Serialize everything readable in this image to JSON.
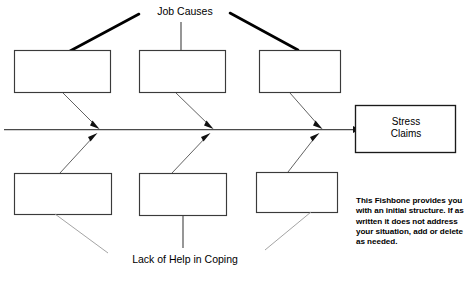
{
  "diagram": {
    "type": "fishbone-cause-and-effect",
    "title_top": "Job Causes",
    "title_bottom": "Lack of Help in Coping",
    "effect": {
      "label_line1": "Stress",
      "label_line2": "Claims"
    },
    "upper_causes": [
      {
        "id": "upper-cause-1",
        "text": ""
      },
      {
        "id": "upper-cause-2",
        "text": ""
      },
      {
        "id": "upper-cause-3",
        "text": ""
      }
    ],
    "lower_causes": [
      {
        "id": "lower-cause-1",
        "text": ""
      },
      {
        "id": "lower-cause-2",
        "text": ""
      },
      {
        "id": "lower-cause-3",
        "text": ""
      }
    ],
    "note": "This Fishbone provides you with an initial structure. If as written it does not address your situation, add or delete as needed.",
    "colors": {
      "ink": "#000000",
      "box_stroke": "#3a3a3a",
      "spine": "#4a4a4a",
      "rib": "#5a5a5a",
      "rib_faint": "#9a9a9a",
      "background": "#ffffff"
    }
  }
}
